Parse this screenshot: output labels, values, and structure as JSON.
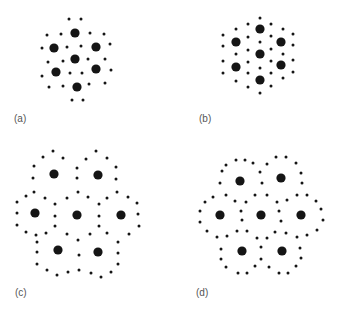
{
  "figure": {
    "colors": {
      "dot": "#151515",
      "label": "#555555"
    },
    "big_radius": 4.6,
    "small_radius": 1.5,
    "panels": [
      {
        "id": "a",
        "label": "(a)",
        "label_pos": [
          14,
          113
        ],
        "big": [
          [
            75,
            33
          ],
          [
            54,
            48
          ],
          [
            96,
            47
          ],
          [
            75,
            59
          ],
          [
            56,
            72
          ],
          [
            96,
            69
          ],
          [
            77,
            87
          ]
        ],
        "small": [
          [
            69,
            19
          ],
          [
            81,
            19
          ],
          [
            47,
            35
          ],
          [
            61,
            34
          ],
          [
            90,
            33
          ],
          [
            104,
            34
          ],
          [
            42,
            48
          ],
          [
            67,
            47
          ],
          [
            81,
            46
          ],
          [
            110,
            44
          ],
          [
            48,
            62
          ],
          [
            63,
            61
          ],
          [
            88,
            59
          ],
          [
            105,
            59
          ],
          [
            42,
            76
          ],
          [
            70,
            73
          ],
          [
            82,
            73
          ],
          [
            111,
            70
          ],
          [
            49,
            87
          ],
          [
            63,
            86
          ],
          [
            89,
            84
          ],
          [
            105,
            83
          ],
          [
            72,
            100
          ],
          [
            83,
            100
          ]
        ]
      },
      {
        "id": "b",
        "label": "(b)",
        "label_pos": [
          199,
          113
        ],
        "big": [
          [
            260,
            29
          ],
          [
            236,
            42
          ],
          [
            281,
            42
          ],
          [
            260,
            54
          ],
          [
            236,
            67
          ],
          [
            281,
            65
          ],
          [
            260,
            80
          ]
        ],
        "small": [
          [
            260,
            18
          ],
          [
            248,
            24
          ],
          [
            271,
            24
          ],
          [
            236,
            29
          ],
          [
            283,
            29
          ],
          [
            223,
            35
          ],
          [
            293,
            34
          ],
          [
            223,
            46
          ],
          [
            248,
            37
          ],
          [
            260,
            42
          ],
          [
            271,
            36
          ],
          [
            293,
            45
          ],
          [
            236,
            54
          ],
          [
            248,
            50
          ],
          [
            271,
            49
          ],
          [
            283,
            54
          ],
          [
            223,
            61
          ],
          [
            248,
            62
          ],
          [
            271,
            61
          ],
          [
            293,
            60
          ],
          [
            223,
            73
          ],
          [
            248,
            73
          ],
          [
            260,
            68
          ],
          [
            271,
            73
          ],
          [
            293,
            72
          ],
          [
            236,
            81
          ],
          [
            283,
            78
          ],
          [
            248,
            87
          ],
          [
            271,
            86
          ],
          [
            260,
            93
          ]
        ]
      },
      {
        "id": "c",
        "label": "(c)",
        "label_pos": [
          15,
          287
        ],
        "big": [
          [
            54,
            174
          ],
          [
            98,
            175
          ],
          [
            35,
            213
          ],
          [
            77,
            215
          ],
          [
            121,
            215
          ],
          [
            58,
            250
          ],
          [
            98,
            252
          ]
        ],
        "small": [
          [
            53,
            151
          ],
          [
            43,
            157
          ],
          [
            63,
            158
          ],
          [
            34,
            166
          ],
          [
            77,
            168
          ],
          [
            33,
            178
          ],
          [
            77,
            178
          ],
          [
            96,
            151
          ],
          [
            86,
            159
          ],
          [
            107,
            158
          ],
          [
            116,
            167
          ],
          [
            116,
            179
          ],
          [
            34,
            192
          ],
          [
            26,
            196
          ],
          [
            45,
            198
          ],
          [
            17,
            202
          ],
          [
            17,
            213
          ],
          [
            17,
            225
          ],
          [
            26,
            232
          ],
          [
            36,
            235
          ],
          [
            46,
            233
          ],
          [
            55,
            204
          ],
          [
            55,
            216
          ],
          [
            55,
            226
          ],
          [
            67,
            198
          ],
          [
            78,
            192
          ],
          [
            88,
            197
          ],
          [
            99,
            204
          ],
          [
            99,
            216
          ],
          [
            99,
            226
          ],
          [
            67,
            234
          ],
          [
            78,
            240
          ],
          [
            90,
            234
          ],
          [
            107,
            198
          ],
          [
            117,
            192
          ],
          [
            128,
            197
          ],
          [
            137,
            203
          ],
          [
            138,
            214
          ],
          [
            139,
            226
          ],
          [
            129,
            234
          ],
          [
            107,
            233
          ],
          [
            37,
            242
          ],
          [
            37,
            252
          ],
          [
            37,
            264
          ],
          [
            47,
            270
          ],
          [
            57,
            275
          ],
          [
            68,
            272
          ],
          [
            79,
            255
          ],
          [
            79,
            270
          ],
          [
            91,
            273
          ],
          [
            101,
            277
          ],
          [
            111,
            272
          ],
          [
            118,
            242
          ],
          [
            118,
            253
          ],
          [
            118,
            264
          ]
        ]
      },
      {
        "id": "d",
        "label": "(d)",
        "label_pos": [
          196,
          287
        ],
        "big": [
          [
            240,
            181
          ],
          [
            281,
            178
          ],
          [
            220,
            215
          ],
          [
            261,
            215
          ],
          [
            301,
            215
          ],
          [
            242,
            251
          ],
          [
            282,
            251
          ]
        ],
        "small": [
          [
            236,
            160
          ],
          [
            245,
            160
          ],
          [
            226,
            165
          ],
          [
            253,
            163
          ],
          [
            222,
            171
          ],
          [
            220,
            183
          ],
          [
            260,
            172
          ],
          [
            262,
            183
          ],
          [
            267,
            164
          ],
          [
            276,
            157
          ],
          [
            286,
            157
          ],
          [
            296,
            163
          ],
          [
            301,
            173
          ],
          [
            302,
            183
          ],
          [
            205,
            202
          ],
          [
            213,
            197
          ],
          [
            226,
            195
          ],
          [
            235,
            201
          ],
          [
            246,
            202
          ],
          [
            255,
            195
          ],
          [
            267,
            195
          ],
          [
            277,
            202
          ],
          [
            287,
            200
          ],
          [
            297,
            195
          ],
          [
            307,
            195
          ],
          [
            316,
            201
          ],
          [
            200,
            211
          ],
          [
            200,
            222
          ],
          [
            241,
            211
          ],
          [
            242,
            220
          ],
          [
            279,
            211
          ],
          [
            281,
            221
          ],
          [
            321,
            209
          ],
          [
            323,
            220
          ],
          [
            207,
            231
          ],
          [
            217,
            237
          ],
          [
            227,
            236
          ],
          [
            237,
            231
          ],
          [
            247,
            231
          ],
          [
            257,
            238
          ],
          [
            267,
            238
          ],
          [
            275,
            232
          ],
          [
            286,
            233
          ],
          [
            297,
            237
          ],
          [
            307,
            235
          ],
          [
            317,
            230
          ],
          [
            221,
            249
          ],
          [
            221,
            259
          ],
          [
            226,
            267
          ],
          [
            238,
            273
          ],
          [
            247,
            273
          ],
          [
            255,
            266
          ],
          [
            261,
            247
          ],
          [
            261,
            259
          ],
          [
            269,
            267
          ],
          [
            279,
            273
          ],
          [
            288,
            273
          ],
          [
            296,
            266
          ],
          [
            300,
            248
          ],
          [
            301,
            258
          ]
        ]
      }
    ]
  }
}
